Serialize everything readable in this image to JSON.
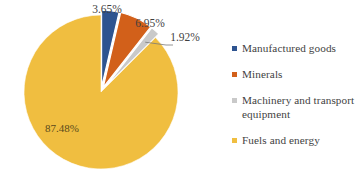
{
  "chart_data": {
    "type": "pie",
    "title": "",
    "unit": "%",
    "legend_position": "right",
    "categories": [
      "Manufactured goods",
      "Minerals",
      "Machinery and transport equipment",
      "Fuels and energy"
    ],
    "values": [
      3.65,
      6.95,
      1.92,
      87.48
    ],
    "labels": [
      "3.65%",
      "6.95%",
      "1.92%",
      "87.48%"
    ],
    "colors": [
      "#2E5490",
      "#D2601A",
      "#C9C9C9",
      "#F0BE40"
    ],
    "exploded": [
      true,
      true,
      true,
      false
    ],
    "start_angle_deg": 0,
    "direction": "clockwise"
  },
  "legend": {
    "items": [
      {
        "label": "Manufactured goods",
        "color": "#2E5490"
      },
      {
        "label": "Minerals",
        "color": "#D2601A"
      },
      {
        "label": "Machinery and transport equipment",
        "color": "#C9C9C9"
      },
      {
        "label": "Fuels and energy",
        "color": "#F0BE40"
      }
    ]
  }
}
